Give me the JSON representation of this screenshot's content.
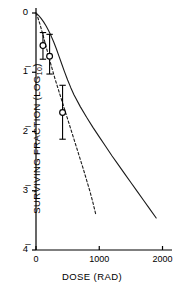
{
  "chart_data": {
    "type": "line",
    "title": "",
    "xlabel": "DOSE (RAD)",
    "ylabel": "SURVIVING FRACTION (LOG10)",
    "ylabel_parts": {
      "main": "SURVIVING  FRACTION (LOG",
      "sub": "10",
      "close": ")"
    },
    "xlim": [
      0,
      2150
    ],
    "ylim": [
      -4,
      0
    ],
    "grid": false,
    "legend": null,
    "xticks": [
      0,
      1000,
      2000
    ],
    "xtick_labels": [
      "0",
      "1000",
      "2000"
    ],
    "yticks": [
      0,
      -1,
      -2,
      -3,
      -4
    ],
    "ytick_labels": [
      "0",
      "1̅",
      "2̅",
      "3̅",
      "4̅"
    ],
    "series": [
      {
        "name": "solid-curve",
        "style": "solid",
        "points": [
          [
            0,
            0.0
          ],
          [
            40,
            -0.04
          ],
          [
            80,
            -0.09
          ],
          [
            120,
            -0.15
          ],
          [
            160,
            -0.22
          ],
          [
            200,
            -0.3
          ],
          [
            240,
            -0.39
          ],
          [
            280,
            -0.49
          ],
          [
            320,
            -0.6
          ],
          [
            360,
            -0.72
          ],
          [
            400,
            -0.84
          ],
          [
            450,
            -0.99
          ],
          [
            500,
            -1.13
          ],
          [
            550,
            -1.26
          ],
          [
            600,
            -1.38
          ],
          [
            700,
            -1.58
          ],
          [
            800,
            -1.76
          ],
          [
            900,
            -1.93
          ],
          [
            1000,
            -2.09
          ],
          [
            1100,
            -2.25
          ],
          [
            1200,
            -2.41
          ],
          [
            1300,
            -2.56
          ],
          [
            1400,
            -2.71
          ],
          [
            1500,
            -2.86
          ],
          [
            1600,
            -3.01
          ],
          [
            1700,
            -3.16
          ],
          [
            1800,
            -3.31
          ],
          [
            1900,
            -3.46
          ]
        ]
      },
      {
        "name": "dashed-curve",
        "style": "dashed",
        "points": [
          [
            0,
            0.0
          ],
          [
            30,
            -0.08
          ],
          [
            60,
            -0.18
          ],
          [
            100,
            -0.33
          ],
          [
            140,
            -0.49
          ],
          [
            180,
            -0.65
          ],
          [
            220,
            -0.81
          ],
          [
            260,
            -0.96
          ],
          [
            300,
            -1.11
          ],
          [
            350,
            -1.28
          ],
          [
            400,
            -1.45
          ],
          [
            450,
            -1.62
          ],
          [
            500,
            -1.79
          ],
          [
            550,
            -1.96
          ],
          [
            600,
            -2.13
          ],
          [
            650,
            -2.3
          ],
          [
            700,
            -2.47
          ],
          [
            750,
            -2.64
          ],
          [
            800,
            -2.82
          ],
          [
            850,
            -3.0
          ],
          [
            900,
            -3.2
          ],
          [
            950,
            -3.42
          ]
        ]
      }
    ],
    "data_points": [
      {
        "x": 110,
        "y": -0.55,
        "yerr_low": -0.78,
        "yerr_high": -0.33,
        "marker": "open-circle"
      },
      {
        "x": 215,
        "y": -0.73,
        "yerr_low": -1.03,
        "yerr_high": -0.36,
        "marker": "open-circle"
      },
      {
        "x": 420,
        "y": -1.68,
        "yerr_low": -2.13,
        "yerr_high": -1.22,
        "marker": "open-circle"
      }
    ],
    "colors": {
      "axis": "#000000",
      "curve": "#1a1a1a",
      "marker": "#000000"
    }
  }
}
